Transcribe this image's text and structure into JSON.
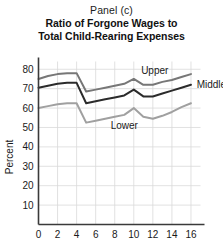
{
  "figure": {
    "panel_label": "Panel (c)",
    "title_line1": "Ratio of Forgone Wages to",
    "title_line2": "Total Child-Rearing Expenses"
  },
  "axes": {
    "ylabel": "Percent",
    "yticks": [
      "80",
      "70",
      "60",
      "50",
      "40",
      "30",
      "20",
      "10"
    ],
    "xticks": [
      "0",
      "2",
      "4",
      "6",
      "8",
      "10",
      "12",
      "14",
      "16"
    ]
  },
  "series_labels": {
    "upper": "Upper",
    "middle": "Middle",
    "lower": "Lower"
  },
  "colors": {
    "upper_line": "#777777",
    "middle_line": "#2b2b2b",
    "lower_line": "#a0a0a0",
    "grid": "#d9d9d9",
    "axis": "#3a3a3a",
    "background": "#ffffff"
  },
  "chart_data": {
    "type": "line",
    "title": "Ratio of Forgone Wages to Total Child-Rearing Expenses",
    "subtitle": "Panel (c)",
    "xlabel": "",
    "ylabel": "Percent",
    "xlim": [
      0,
      17
    ],
    "ylim": [
      0,
      84
    ],
    "xticks": [
      0,
      2,
      4,
      6,
      8,
      10,
      12,
      14,
      16
    ],
    "yticks": [
      10,
      20,
      30,
      40,
      50,
      60,
      70,
      80
    ],
    "grid": true,
    "legend": "inline-annotations",
    "x": [
      0,
      1,
      2,
      3,
      4,
      5,
      6,
      7,
      8,
      9,
      10,
      11,
      12,
      13,
      14,
      15,
      16
    ],
    "series": [
      {
        "name": "Upper",
        "color": "#777777",
        "values": [
          75.0,
          76.5,
          77.5,
          78.0,
          78.0,
          68.5,
          69.5,
          70.5,
          71.5,
          72.5,
          75.0,
          72.0,
          72.0,
          73.5,
          74.5,
          76.0,
          77.5
        ]
      },
      {
        "name": "Middle",
        "color": "#2b2b2b",
        "values": [
          70.5,
          71.5,
          72.5,
          73.0,
          73.0,
          62.5,
          63.5,
          64.5,
          65.5,
          66.5,
          69.5,
          66.0,
          66.0,
          67.5,
          69.0,
          70.5,
          72.0
        ]
      },
      {
        "name": "Lower",
        "color": "#a0a0a0",
        "values": [
          60.0,
          61.0,
          62.0,
          62.5,
          62.5,
          52.5,
          53.5,
          54.5,
          55.5,
          56.5,
          60.0,
          55.5,
          54.5,
          56.0,
          58.0,
          60.5,
          62.5
        ]
      }
    ],
    "annotations": [
      {
        "text": "Upper",
        "x": 12.2,
        "y": 79.5
      },
      {
        "text": "Middle",
        "x": 16.6,
        "y": 72.0
      },
      {
        "text": "Lower",
        "x": 9.0,
        "y": 51.0
      }
    ]
  }
}
